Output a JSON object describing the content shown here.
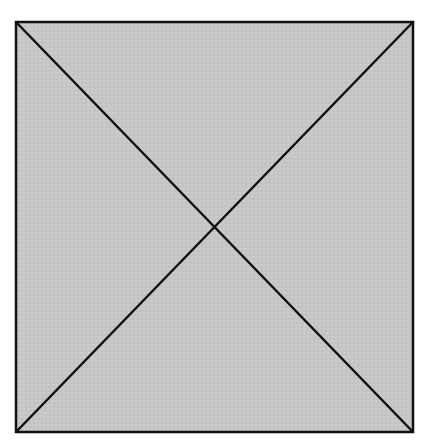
{
  "diagram": {
    "shape": "square",
    "fill_color": "#c6c6c6",
    "stroke_color": "#111111",
    "stroke_width": 2.5,
    "square": {
      "x": 16,
      "y": 22,
      "width": 397,
      "height": 410
    },
    "diagonals": [
      {
        "from": [
          16,
          22
        ],
        "to": [
          413,
          432
        ]
      },
      {
        "from": [
          413,
          22
        ],
        "to": [
          16,
          432
        ]
      }
    ],
    "intersection": [
      215,
      227
    ]
  }
}
